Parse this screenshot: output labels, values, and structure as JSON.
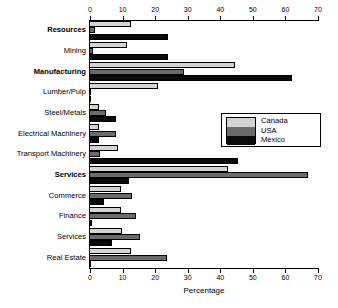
{
  "chart_data": {
    "type": "bar",
    "orientation": "horizontal",
    "title": "",
    "xlabel": "Percentage",
    "ylabel": "",
    "xlim": [
      0,
      70
    ],
    "xticks": [
      0,
      10,
      20,
      30,
      40,
      50,
      60,
      70
    ],
    "xtick_labels": [
      "0",
      "10",
      "20",
      "30",
      "40",
      "50",
      "60",
      "70"
    ],
    "grid": false,
    "legend_position": "center-right",
    "axis_top": true,
    "axis_bottom": true,
    "categories": [
      "Resources",
      "Mining",
      "Manufacturing",
      "Lumber/Pulp",
      "Steel/Metals",
      "Electrical Machinery",
      "Transport Machinery",
      "Services",
      "Commerce",
      "Finance",
      "Services",
      "Real Estate"
    ],
    "category_bold": [
      true,
      false,
      true,
      false,
      false,
      false,
      false,
      true,
      false,
      false,
      false,
      false
    ],
    "series": [
      {
        "name": "Canada",
        "color": "#d4d4d4",
        "values": [
          12.5,
          11.5,
          44.5,
          21.0,
          2.8,
          2.8,
          8.5,
          42.5,
          9.5,
          9.5,
          9.8,
          12.5
        ]
      },
      {
        "name": "USA",
        "color": "#6b6b6b",
        "values": [
          1.5,
          1.0,
          29.0,
          0.4,
          5.0,
          8.0,
          3.0,
          67.0,
          12.8,
          14.0,
          15.5,
          23.5
        ]
      },
      {
        "name": "Mexico",
        "color": "#0a0a0a",
        "values": [
          24.0,
          24.0,
          62.0,
          0.0,
          8.0,
          2.8,
          45.5,
          12.0,
          4.2,
          0.6,
          6.8,
          0.0
        ]
      }
    ]
  },
  "legend": {
    "entries": [
      "Canada",
      "USA",
      "Mexico"
    ]
  },
  "axis": {
    "x_label": "Percentage"
  }
}
